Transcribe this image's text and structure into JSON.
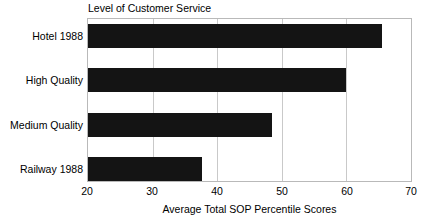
{
  "chart_data": {
    "type": "bar",
    "orientation": "horizontal",
    "title": "Level of Customer Service",
    "xlabel": "Average Total SOP Percentile Scores",
    "ylabel": "",
    "categories": [
      "Hotel 1988",
      "High Quality",
      "Medium Quality",
      "Railway 1988"
    ],
    "values": [
      65.5,
      60.0,
      48.5,
      37.7
    ],
    "xlim": [
      20,
      70
    ],
    "xticks": [
      20,
      30,
      40,
      50,
      60,
      70
    ],
    "xtick_labels": [
      "20",
      "30",
      "40",
      "50",
      "60",
      "70"
    ],
    "grid": true,
    "grid_axis": "x",
    "legend": false,
    "bar_color": "#141414",
    "frame_color": "#b9b9b9",
    "gridline_color": "#c9c9c9",
    "background": "#ffffff"
  },
  "figure": {
    "title_text": "Level of Customer Service",
    "xaxis_title_text": "Average Total SOP Percentile Scores"
  }
}
